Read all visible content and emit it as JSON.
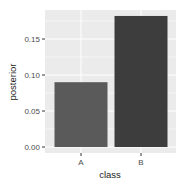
{
  "chart_data": {
    "type": "bar",
    "title": "",
    "xlabel": "class",
    "ylabel": "posterior",
    "categories": [
      "A",
      "B"
    ],
    "values": [
      0.09,
      0.182
    ],
    "ylim": [
      0,
      0.19
    ],
    "yticks": [
      0.0,
      0.05,
      0.1,
      0.15
    ],
    "ytick_labels": [
      "0.00",
      "0.05",
      "0.10",
      "0.15"
    ],
    "grid": true,
    "legend": "none",
    "bar_colors": [
      "#5a5a5a",
      "#3d3d3d"
    ],
    "panel_background": "#ebebeb",
    "gridline_color": "#ffffff"
  }
}
